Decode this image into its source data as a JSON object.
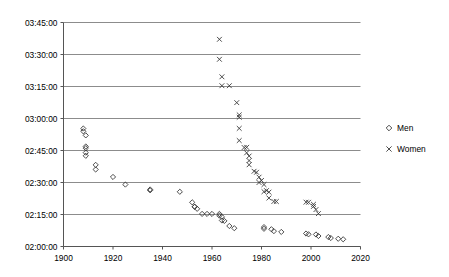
{
  "chart_data": {
    "type": "scatter",
    "title": "",
    "xlabel": "",
    "ylabel": "",
    "xlim": [
      1900,
      2020
    ],
    "ylim": [
      "02:00:00",
      "03:45:00"
    ],
    "grid": true,
    "grid_axis": "y",
    "legend_position": "right",
    "xticks": [
      1900,
      1920,
      1940,
      1960,
      1980,
      2000,
      2020
    ],
    "yticks": [
      "02:00:00",
      "02:15:00",
      "02:30:00",
      "02:45:00",
      "03:00:00",
      "03:15:00",
      "03:30:00",
      "03:45:00"
    ],
    "series": [
      {
        "name": "Men",
        "marker": "diamond",
        "color": "#333333",
        "points": [
          [
            1908,
            "02:55:18"
          ],
          [
            1908,
            "02:54:00"
          ],
          [
            1909,
            "02:52:05"
          ],
          [
            1909,
            "02:46:05"
          ],
          [
            1909,
            "02:46:53"
          ],
          [
            1909,
            "02:44:00"
          ],
          [
            1909,
            "02:42:31"
          ],
          [
            1913,
            "02:38:16"
          ],
          [
            1913,
            "02:36:06"
          ],
          [
            1920,
            "02:32:36"
          ],
          [
            1925,
            "02:29:02"
          ],
          [
            1935,
            "02:26:44"
          ],
          [
            1935,
            "02:26:20"
          ],
          [
            1947,
            "02:25:39"
          ],
          [
            1952,
            "02:20:42"
          ],
          [
            1953,
            "02:18:41"
          ],
          [
            1953,
            "02:18:35"
          ],
          [
            1954,
            "02:17:40"
          ],
          [
            1956,
            "02:15:17"
          ],
          [
            1958,
            "02:15:17"
          ],
          [
            1960,
            "02:15:16"
          ],
          [
            1963,
            "02:15:16"
          ],
          [
            1963,
            "02:14:28"
          ],
          [
            1964,
            "02:13:55"
          ],
          [
            1964,
            "02:12:12"
          ],
          [
            1965,
            "02:12:00"
          ],
          [
            1967,
            "02:09:37"
          ],
          [
            1969,
            "02:08:34"
          ],
          [
            1981,
            "02:08:18"
          ],
          [
            1981,
            "02:09:06"
          ],
          [
            1984,
            "02:08:05"
          ],
          [
            1985,
            "02:07:12"
          ],
          [
            1988,
            "02:06:50"
          ],
          [
            1998,
            "02:06:05"
          ],
          [
            1999,
            "02:05:42"
          ],
          [
            2002,
            "02:05:38"
          ],
          [
            2003,
            "02:04:55"
          ],
          [
            2007,
            "02:04:26"
          ],
          [
            2008,
            "02:03:59"
          ],
          [
            2011,
            "02:03:38"
          ],
          [
            2013,
            "02:03:23"
          ]
        ]
      },
      {
        "name": "Women",
        "marker": "cross",
        "color": "#333333",
        "points": [
          [
            1963,
            "03:37:07"
          ],
          [
            1963,
            "03:27:45"
          ],
          [
            1964,
            "03:19:33"
          ],
          [
            1964,
            "03:15:22"
          ],
          [
            1967,
            "03:15:22"
          ],
          [
            1970,
            "03:07:26"
          ],
          [
            1971,
            "03:01:42"
          ],
          [
            1971,
            "03:00:35"
          ],
          [
            1971,
            "02:55:22"
          ],
          [
            1971,
            "02:49:40"
          ],
          [
            1973,
            "02:46:24"
          ],
          [
            1974,
            "02:46:30"
          ],
          [
            1974,
            "02:43:55"
          ],
          [
            1975,
            "02:42:24"
          ],
          [
            1975,
            "02:40:16"
          ],
          [
            1975,
            "02:38:19"
          ],
          [
            1977,
            "02:35:16"
          ],
          [
            1978,
            "02:34:48"
          ],
          [
            1979,
            "02:32:30"
          ],
          [
            1979,
            "02:30:00"
          ],
          [
            1980,
            "02:30:58"
          ],
          [
            1981,
            "02:29:02"
          ],
          [
            1981,
            "02:25:42"
          ],
          [
            1982,
            "02:26:12"
          ],
          [
            1983,
            "02:25:29"
          ],
          [
            1983,
            "02:22:43"
          ],
          [
            1985,
            "02:21:06"
          ],
          [
            1986,
            "02:21:06"
          ],
          [
            1998,
            "02:20:47"
          ],
          [
            1999,
            "02:20:43"
          ],
          [
            2001,
            "02:19:46"
          ],
          [
            2001,
            "02:18:47"
          ],
          [
            2002,
            "02:17:18"
          ],
          [
            2003,
            "02:15:25"
          ]
        ]
      }
    ]
  },
  "legend": {
    "items": [
      {
        "label": "Men",
        "marker": "diamond"
      },
      {
        "label": "Women",
        "marker": "cross"
      }
    ]
  }
}
